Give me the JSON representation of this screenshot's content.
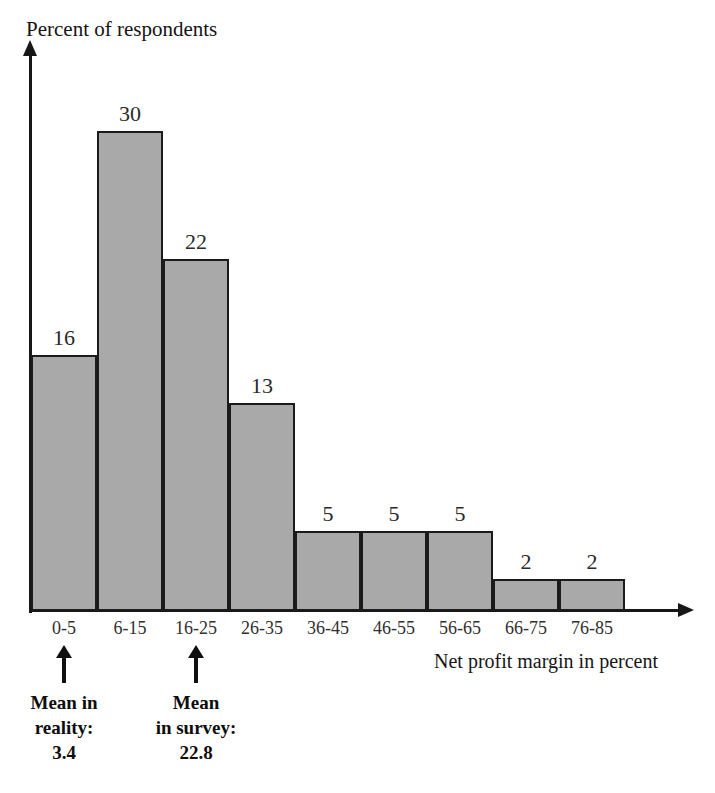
{
  "chart_data": {
    "type": "bar",
    "title": "",
    "ylabel": "Percent of respondents",
    "xlabel": "Net profit margin in percent",
    "categories": [
      "0-5",
      "6-15",
      "16-25",
      "26-35",
      "36-45",
      "46-55",
      "56-65",
      "66-75",
      "76-85"
    ],
    "values": [
      16,
      30,
      22,
      13,
      5,
      5,
      5,
      2,
      2
    ],
    "ylim": [
      0,
      30
    ],
    "grid": false,
    "legend": false,
    "bar_color": "#a9a9a9",
    "bar_border_color": "#1b1b1b",
    "annotations": [
      {
        "id": "mean-in-reality",
        "category": "0-5",
        "lines": [
          "Mean in",
          "reality:",
          "3.4"
        ],
        "value": "3.4"
      },
      {
        "id": "mean-in-survey",
        "category": "16-25",
        "lines": [
          "Mean",
          "in survey:",
          "22.8"
        ],
        "value": "22.8"
      }
    ]
  },
  "axes": {
    "y_title": "Percent of respondents",
    "x_title": "Net profit margin in percent"
  },
  "bars": [
    {
      "label": "0-5",
      "value": "16"
    },
    {
      "label": "6-15",
      "value": "30"
    },
    {
      "label": "16-25",
      "value": "22"
    },
    {
      "label": "26-35",
      "value": "13"
    },
    {
      "label": "36-45",
      "value": "5"
    },
    {
      "label": "46-55",
      "value": "5"
    },
    {
      "label": "56-65",
      "value": "5"
    },
    {
      "label": "66-75",
      "value": "2"
    },
    {
      "label": "76-85",
      "value": "2"
    }
  ],
  "annotation_reality": {
    "line1": "Mean in",
    "line2": "reality:",
    "line3": "3.4"
  },
  "annotation_survey": {
    "line1": "Mean",
    "line2": "in survey:",
    "line3": "22.8"
  }
}
